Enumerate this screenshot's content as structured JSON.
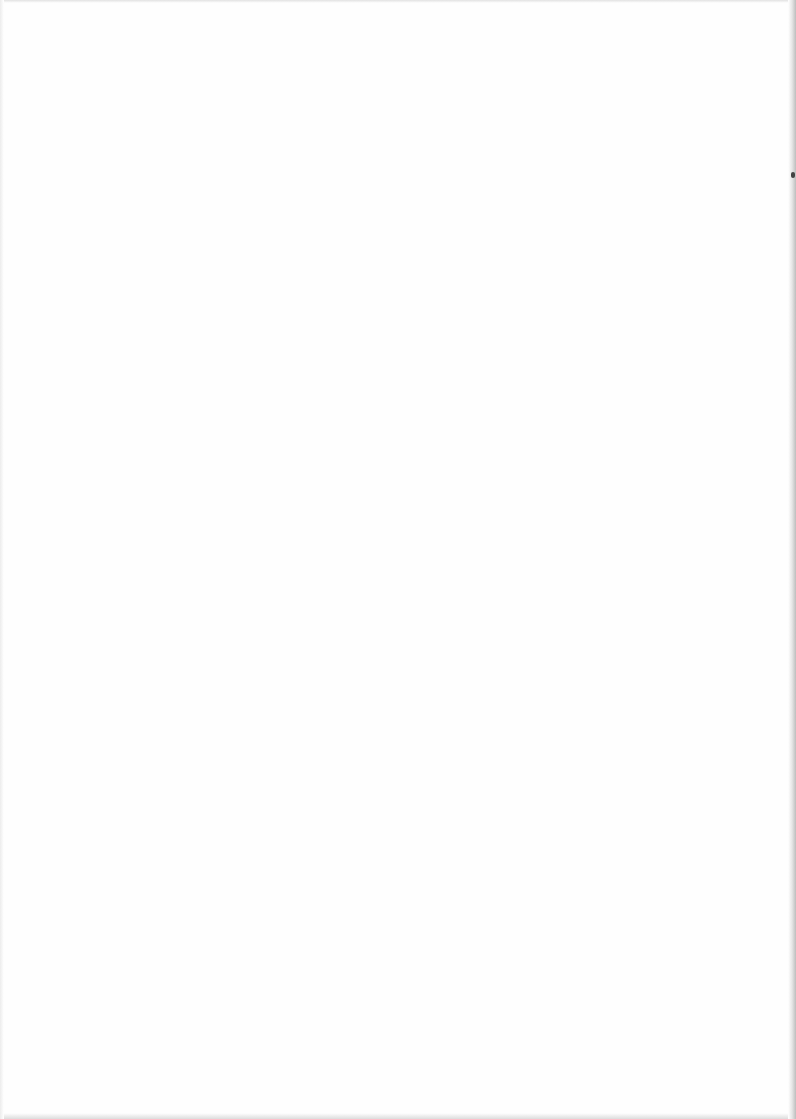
{
  "page": {
    "type": "scanned-blank-page",
    "background": "#fefefe",
    "edge_color": "#bdbdbd"
  },
  "bleed_through": {
    "legible": false,
    "lines": [
      "",
      ""
    ]
  }
}
